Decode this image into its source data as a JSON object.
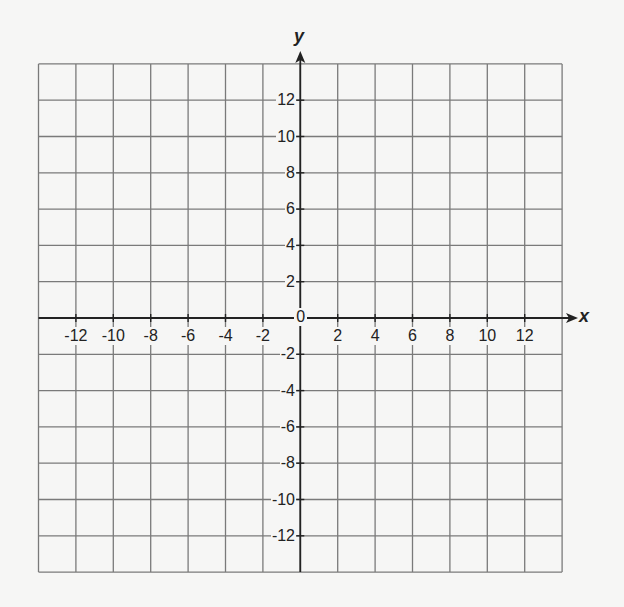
{
  "chart_data": {
    "type": "scatter",
    "title": "",
    "xlabel": "x",
    "ylabel": "y",
    "xlim": [
      -14,
      14
    ],
    "ylim": [
      -14,
      14
    ],
    "grid": true,
    "grid_step": 2,
    "x_ticks": [
      -12,
      -10,
      -8,
      -6,
      -4,
      -2,
      2,
      4,
      6,
      8,
      10,
      12
    ],
    "y_ticks": [
      12,
      10,
      8,
      6,
      4,
      2,
      -2,
      -4,
      -6,
      -8,
      -10,
      -12
    ],
    "origin_label": "0",
    "series": [],
    "legend": null
  },
  "colors": {
    "background": "#f6f6f5",
    "grid": "#7a7a7a",
    "axis": "#222222"
  }
}
